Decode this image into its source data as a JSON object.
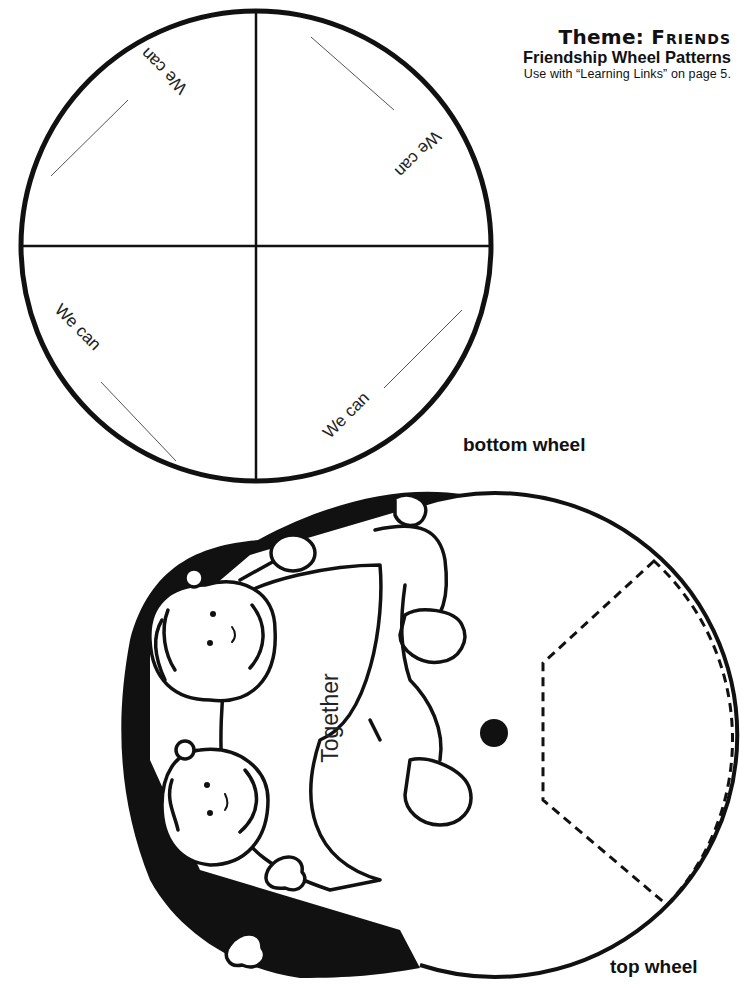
{
  "header": {
    "theme_prefix": "Theme:",
    "theme_name": "Friends",
    "title": "Friendship Wheel Patterns",
    "note": "Use with “Learning Links” on page 5."
  },
  "bottom_wheel": {
    "label": "bottom wheel",
    "sections": [
      {
        "position": "top-left",
        "text": "We can"
      },
      {
        "position": "top-right",
        "text": "We can"
      },
      {
        "position": "bottom-left",
        "text": "We can"
      },
      {
        "position": "bottom-right",
        "text": "We can"
      }
    ]
  },
  "top_wheel": {
    "label": "top wheel",
    "caption": "Together",
    "illustration": "two-children-hugging",
    "window": "dashed-cutout"
  },
  "colors": {
    "ink": "#111111",
    "paper": "#ffffff"
  }
}
